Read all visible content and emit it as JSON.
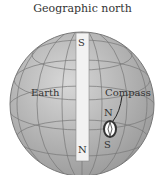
{
  "title": "Geographic north",
  "labels": {
    "earth": "Earth",
    "compass": "Compass",
    "magnet_top": "S",
    "magnet_bottom": "N",
    "compass_north": "N",
    "compass_south": "S"
  },
  "colors": {
    "globe": "#b8b8b8",
    "grid": "#7a7a7a",
    "magnet": "#f2f2f2"
  }
}
